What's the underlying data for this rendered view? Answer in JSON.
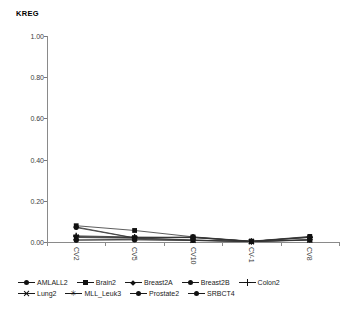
{
  "chart_data": {
    "type": "line",
    "title": "KREG",
    "xlabel": "",
    "ylabel": "",
    "ylim": [
      0.0,
      1.0
    ],
    "ytick_labels": [
      "1.00",
      "0.80",
      "0.60",
      "0.40",
      "0.20",
      "0.00"
    ],
    "ytick_values": [
      1.0,
      0.8,
      0.6,
      0.4,
      0.2,
      0.0
    ],
    "grid": false,
    "legend_position": "bottom",
    "categories": [
      "CV2",
      "CV5",
      "CV10",
      "CV-1",
      "CV8"
    ],
    "series": [
      {
        "name": "AMLALL2",
        "marker": "circle",
        "values": [
          0.025,
          0.022,
          0.021,
          0.003,
          0.022
        ]
      },
      {
        "name": "Brain2",
        "marker": "square",
        "values": [
          0.079,
          0.056,
          0.025,
          0.004,
          0.027
        ]
      },
      {
        "name": "Breast2A",
        "marker": "diamond",
        "values": [
          0.073,
          0.02,
          0.01,
          0.002,
          0.012
        ]
      },
      {
        "name": "Breast2B",
        "marker": "circle",
        "values": [
          0.07,
          0.019,
          0.024,
          0.003,
          0.025
        ]
      },
      {
        "name": "Colon2",
        "marker": "plus",
        "values": [
          0.03,
          0.024,
          0.023,
          0.003,
          0.024
        ]
      },
      {
        "name": "Lung2",
        "marker": "cross",
        "values": [
          0.022,
          0.018,
          0.009,
          0.002,
          0.01
        ]
      },
      {
        "name": "MLL_Leuk3",
        "marker": "star",
        "values": [
          0.026,
          0.021,
          0.022,
          0.003,
          0.023
        ]
      },
      {
        "name": "Prostate2",
        "marker": "circle",
        "values": [
          0.01,
          0.013,
          0.008,
          0.002,
          0.011
        ]
      },
      {
        "name": "SRBCT4",
        "marker": "circle",
        "values": [
          0.009,
          0.01,
          0.007,
          0.002,
          0.009
        ]
      }
    ]
  },
  "legend": {
    "rows": [
      [
        "AMLALL2",
        "Brain2",
        "Breast2A",
        "Breast2B",
        "Colon2"
      ],
      [
        "Lung2",
        "MLL_Leuk3",
        "Prostate2",
        "SRBCT4"
      ]
    ]
  }
}
